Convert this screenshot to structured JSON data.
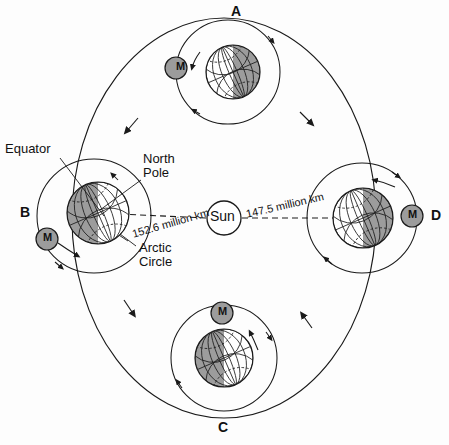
{
  "diagram": {
    "background_color": "#fdfdfd",
    "line_color": "#1a1a1a",
    "shadow_fill": "#9c9c9c",
    "light_fill": "#ffffff",
    "moon_fill": "#9c9c9c"
  },
  "center_body": {
    "label": "Sun",
    "cx": 224,
    "cy": 218,
    "r": 17
  },
  "orbit": {
    "cx": 224,
    "cy": 218,
    "rx": 152,
    "ry": 200,
    "direction": "clockwise",
    "arrow_count": 4
  },
  "positions": [
    {
      "id": "A",
      "label": "A",
      "label_x": 231,
      "label_y": 6,
      "earth_cx": 233,
      "earth_cy": 72,
      "earth_r": 27,
      "moon_label": "M",
      "moon_cx": 176,
      "moon_cy": 68,
      "moon_r": 11,
      "shadow_side": "right",
      "tilt_deg": -23.5
    },
    {
      "id": "B",
      "label": "B",
      "label_x": 20,
      "label_y": 207,
      "earth_cx": 98,
      "earth_cy": 213,
      "earth_r": 31,
      "moon_label": "M",
      "moon_cx": 47,
      "moon_cy": 239,
      "moon_r": 11,
      "shadow_side": "left",
      "tilt_deg": -23.5
    },
    {
      "id": "C",
      "label": "C",
      "label_x": 218,
      "label_y": 422,
      "earth_cx": 224,
      "earth_cy": 358,
      "earth_r": 29,
      "moon_label": "M",
      "moon_cx": 222,
      "moon_cy": 313,
      "moon_r": 11,
      "shadow_side": "left",
      "tilt_deg": -23.5
    },
    {
      "id": "D",
      "label": "D",
      "label_x": 431,
      "label_y": 210,
      "earth_cx": 363,
      "earth_cy": 218,
      "earth_r": 30,
      "moon_label": "M",
      "moon_cx": 412,
      "moon_cy": 216,
      "moon_r": 11,
      "shadow_side": "right",
      "tilt_deg": -23.5
    }
  ],
  "distance_labels": [
    {
      "text": "152.6 million km",
      "x": 131,
      "y": 236,
      "rotation_deg": -16,
      "from": "Sun",
      "to": "B"
    },
    {
      "text": "147.5 million km",
      "x": 245,
      "y": 213,
      "rotation_deg": -13,
      "from": "Sun",
      "to": "D"
    }
  ],
  "annotations": [
    {
      "name": "equator",
      "text": "Equator",
      "x": 5,
      "y": 143,
      "lines": [
        "Equator"
      ],
      "leader_from": [
        60,
        160
      ],
      "leader_to": [
        103,
        215
      ]
    },
    {
      "name": "north-pole",
      "text": "North Pole",
      "x": 143,
      "y": 153,
      "lines": [
        "North",
        "Pole"
      ],
      "leader_from": [
        141,
        178
      ],
      "leader_to": [
        100,
        209
      ]
    },
    {
      "name": "arctic-circle",
      "text": "Arctic Circle",
      "x": 139,
      "y": 243,
      "lines": [
        "Arctic",
        "Circle"
      ],
      "leader_from": [
        137,
        245
      ],
      "leader_to": [
        115,
        232
      ]
    }
  ],
  "globe_grid": {
    "meridians": 8,
    "parallels": 4,
    "axis_label": "rotation axis tilted 23.5 degrees"
  }
}
